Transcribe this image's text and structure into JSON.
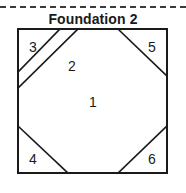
{
  "page": {
    "title": "Foundation 2",
    "background_color": "#ffffff",
    "line_color": "#1a1a1a",
    "divider_color": "#3a3a3a"
  },
  "divider": {
    "style": "dashed",
    "name": "dashed-divider"
  },
  "diagram": {
    "type": "foundation-paper-piecing-block",
    "shape": "square-with-octagon-center",
    "patches": [
      {
        "number": "1",
        "x": 93,
        "y": 103
      },
      {
        "number": "2",
        "x": 72,
        "y": 67
      },
      {
        "number": "3",
        "x": 33,
        "y": 48
      },
      {
        "number": "4",
        "x": 33,
        "y": 160
      },
      {
        "number": "5",
        "x": 152,
        "y": 48
      },
      {
        "number": "6",
        "x": 152,
        "y": 160
      }
    ],
    "outline": {
      "left": 18,
      "top": 29,
      "right": 167,
      "bottom": 173
    },
    "seam_lines": [
      {
        "name": "top-left-outer-seam",
        "x1": 18,
        "y1": 88,
        "x2": 78,
        "y2": 29
      },
      {
        "name": "top-left-inner-seam",
        "x1": 18,
        "y1": 72,
        "x2": 60,
        "y2": 29
      },
      {
        "name": "top-right-seam",
        "x1": 118,
        "y1": 29,
        "x2": 167,
        "y2": 76
      },
      {
        "name": "bottom-left-seam",
        "x1": 18,
        "y1": 126,
        "x2": 68,
        "y2": 173
      },
      {
        "name": "bottom-right-seam",
        "x1": 118,
        "y1": 173,
        "x2": 167,
        "y2": 126
      }
    ]
  }
}
